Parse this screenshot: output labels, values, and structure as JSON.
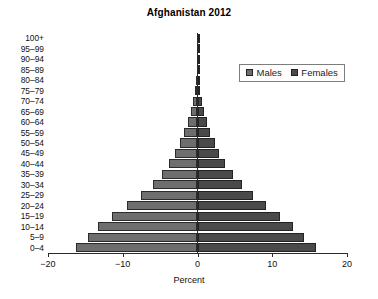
{
  "chart_data": {
    "type": "bar",
    "subtype": "population-pyramid",
    "title": "Afghanistan 2012",
    "xlabel": "Percent",
    "ylabel": "",
    "xlim": [
      -20,
      20
    ],
    "xticks": [
      -20,
      -10,
      0,
      10,
      20
    ],
    "xtick_labels": [
      "−20",
      "−10",
      "0",
      "10",
      "20"
    ],
    "grid": false,
    "legend_position": "upper right",
    "categories": [
      "0–4",
      "5–9",
      "10–14",
      "15–19",
      "20–24",
      "25–29",
      "30–34",
      "35–39",
      "40–44",
      "45–49",
      "50–54",
      "55–59",
      "60–64",
      "65–69",
      "70–74",
      "75–79",
      "80–84",
      "85–89",
      "90–94",
      "95–99",
      "100+"
    ],
    "series": [
      {
        "name": "Males",
        "color": "#6e6e6e",
        "side": "left",
        "values": [
          -16.2,
          -14.7,
          -13.3,
          -11.4,
          -9.4,
          -7.6,
          -6.0,
          -4.8,
          -3.8,
          -3.0,
          -2.4,
          -1.8,
          -1.3,
          -0.9,
          -0.6,
          -0.35,
          -0.2,
          -0.1,
          -0.05,
          -0.02,
          -0.01
        ]
      },
      {
        "name": "Females",
        "color": "#4a4a4a",
        "side": "right",
        "values": [
          15.9,
          14.2,
          12.8,
          11.0,
          9.1,
          7.4,
          5.9,
          4.7,
          3.7,
          2.9,
          2.3,
          1.7,
          1.25,
          0.85,
          0.55,
          0.33,
          0.18,
          0.09,
          0.04,
          0.02,
          0.01
        ]
      }
    ]
  },
  "legend": {
    "males_label": "Males",
    "females_label": "Females"
  }
}
